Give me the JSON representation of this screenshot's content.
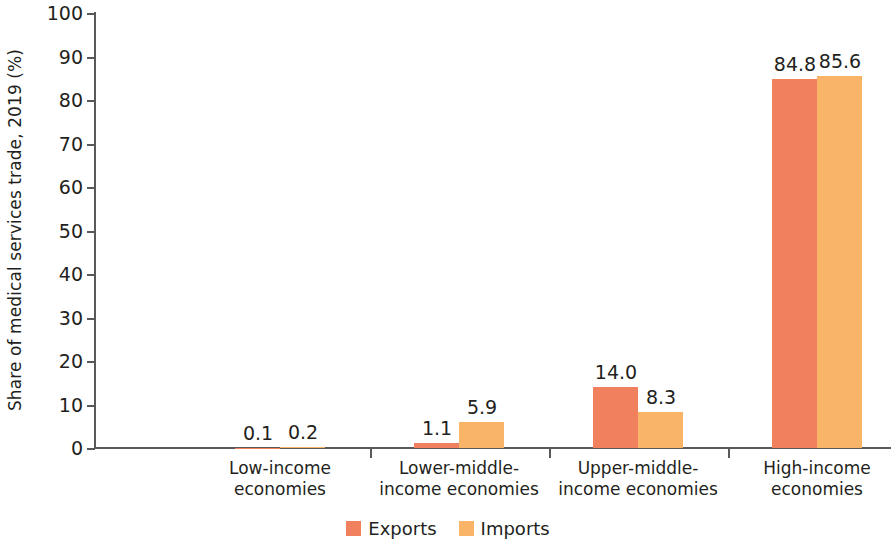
{
  "chart_data": {
    "type": "bar",
    "title": "",
    "subtitle": "",
    "xlabel": "",
    "ylabel": "Share of medical services trade, 2019 (%)",
    "ylim": [
      0,
      100
    ],
    "ytick_labels": [
      "0",
      "10",
      "20",
      "30",
      "40",
      "50",
      "60",
      "70",
      "80",
      "90",
      "100"
    ],
    "ytick_values": [
      0,
      10,
      20,
      30,
      40,
      50,
      60,
      70,
      80,
      90,
      100
    ],
    "grid": false,
    "legend_position": "bottom-center",
    "categories": [
      "Low-income\neconomies",
      "Lower-middle-\nincome economies",
      "Upper-middle-\nincome economies",
      "High-income\neconomies"
    ],
    "category_lines": [
      [
        "Low-income",
        "economies"
      ],
      [
        "Lower-middle-",
        "income economies"
      ],
      [
        "Upper-middle-",
        "income economies"
      ],
      [
        "High-income",
        "economies"
      ]
    ],
    "series": [
      {
        "name": "Exports",
        "color": "#f0805e",
        "values": [
          0.1,
          1.1,
          14.0,
          84.8
        ],
        "labels": [
          "0.1",
          "1.1",
          "14.0",
          "84.8"
        ]
      },
      {
        "name": "Imports",
        "color": "#f9b468",
        "values": [
          0.2,
          5.9,
          8.3,
          85.6
        ],
        "labels": [
          "0.2",
          "5.9",
          "8.3",
          "85.6"
        ]
      }
    ]
  },
  "legend": {
    "items": [
      {
        "label": "Exports",
        "color": "#f0805e"
      },
      {
        "label": "Imports",
        "color": "#f9b468"
      }
    ]
  },
  "axes": {
    "y_title": "Share of medical services trade, 2019 (%)"
  }
}
